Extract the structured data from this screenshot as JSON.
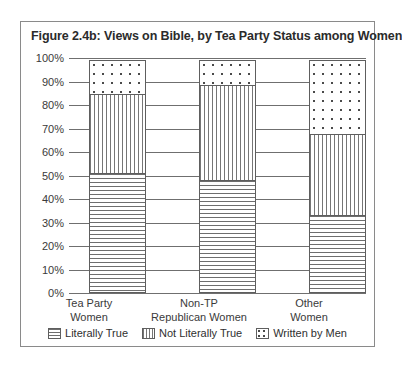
{
  "chart_data": {
    "type": "bar",
    "title": "Figure 2.4b: Views on Bible, by Tea Party Status among Women",
    "xlabel": "",
    "ylabel": "",
    "ylim": [
      0,
      100
    ],
    "stacked": true,
    "grid": true,
    "legend_position": "bottom",
    "categories": [
      "Tea Party Women",
      "Non-TP Republican Women",
      "Other Women"
    ],
    "category_lines": [
      [
        "Tea Party",
        "Women"
      ],
      [
        "Non-TP",
        "Republican Women"
      ],
      [
        "Other",
        "Women"
      ]
    ],
    "ytick_labels": [
      "100%",
      "90%",
      "80%",
      "70%",
      "60%",
      "50%",
      "40%",
      "30%",
      "20%",
      "10%",
      "0%"
    ],
    "ytick_values": [
      100,
      90,
      80,
      70,
      60,
      50,
      40,
      30,
      20,
      10,
      0
    ],
    "series": [
      {
        "name": "Literally True",
        "pattern": "horizontal-lines",
        "values": [
          51,
          48,
          33
        ]
      },
      {
        "name": "Not Literally True",
        "pattern": "vertical-lines",
        "values": [
          34,
          41,
          35
        ]
      },
      {
        "name": "Written by Men",
        "pattern": "dots",
        "values": [
          15,
          11,
          32
        ]
      }
    ]
  },
  "colors": {
    "frame": "#8a8a8a",
    "axis": "#6f6f6f",
    "text": "#2b2b2b",
    "pattern": "#6e6e6e"
  }
}
